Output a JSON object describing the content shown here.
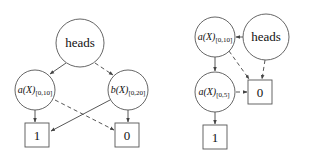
{
  "diagrams": [
    {
      "id": "left",
      "nodes": {
        "heads": {
          "label": "heads"
        },
        "a": {
          "var": "a(X)",
          "sub": "[0,10]"
        },
        "b": {
          "var": "b(X)",
          "sub": "[0,20]"
        },
        "one": {
          "label": "1"
        },
        "zero": {
          "label": "0"
        }
      },
      "edges": [
        {
          "from": "heads",
          "to": "a",
          "style": "solid"
        },
        {
          "from": "heads",
          "to": "b",
          "style": "dashed"
        },
        {
          "from": "a",
          "to": "one",
          "style": "solid"
        },
        {
          "from": "a",
          "to": "zero",
          "style": "dashed"
        },
        {
          "from": "b",
          "to": "one",
          "style": "solid"
        },
        {
          "from": "b",
          "to": "zero",
          "style": "dashed"
        }
      ]
    },
    {
      "id": "right",
      "nodes": {
        "heads": {
          "label": "heads"
        },
        "a10": {
          "var": "a(X)",
          "sub": "[0,10]"
        },
        "a5": {
          "var": "a(X)",
          "sub": "[0,5]"
        },
        "one": {
          "label": "1"
        },
        "zero": {
          "label": "0"
        }
      },
      "edges": [
        {
          "from": "heads",
          "to": "a10",
          "style": "solid"
        },
        {
          "from": "heads",
          "to": "zero",
          "style": "dashed"
        },
        {
          "from": "a10",
          "to": "a5",
          "style": "solid"
        },
        {
          "from": "a10",
          "to": "zero",
          "style": "dashed"
        },
        {
          "from": "a5",
          "to": "one",
          "style": "solid"
        },
        {
          "from": "a5",
          "to": "zero",
          "style": "dashed"
        }
      ]
    }
  ]
}
